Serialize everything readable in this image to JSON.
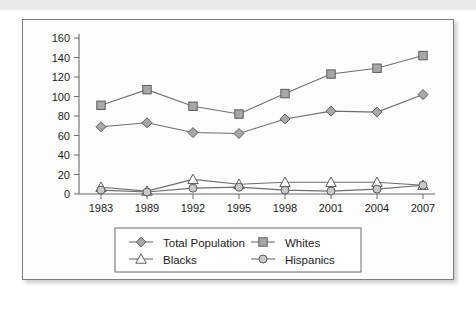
{
  "figure": {
    "frame_border_color": "#7d7d7d",
    "background_color": "#fdfdfd",
    "top_band_color": "#e8e8e8"
  },
  "chart_data": {
    "type": "line",
    "title": "",
    "subtitle": "",
    "xlabel": "",
    "ylabel": "",
    "categories": [
      "1983",
      "1989",
      "1992",
      "1995",
      "1998",
      "2001",
      "2004",
      "2007"
    ],
    "ylim": [
      0,
      160
    ],
    "yticks": [
      0,
      20,
      40,
      60,
      80,
      100,
      120,
      140,
      160
    ],
    "ytick_labels": [
      "0",
      "20",
      "40",
      "60",
      "80",
      "100",
      "120",
      "140",
      "160"
    ],
    "grid": false,
    "legend_position": "bottom",
    "series": [
      {
        "name": "Total Population",
        "marker": "diamond",
        "marker_style": "filled-gray",
        "values": [
          69,
          73,
          63,
          62,
          77,
          85,
          84,
          102
        ]
      },
      {
        "name": "Whites",
        "marker": "square",
        "marker_style": "filled-gray",
        "values": [
          91,
          107,
          90,
          82,
          103,
          123,
          129,
          142
        ]
      },
      {
        "name": "Blacks",
        "marker": "triangle",
        "marker_style": "open",
        "values": [
          7,
          3,
          15,
          10,
          12,
          12,
          12,
          9
        ]
      },
      {
        "name": "Hispanics",
        "marker": "circle",
        "marker_style": "filled-light-gray",
        "values": [
          4,
          2,
          6,
          7,
          4,
          3,
          5,
          9
        ]
      }
    ],
    "legend_entries": [
      {
        "label": "Total Population",
        "marker": "diamond"
      },
      {
        "label": "Whites",
        "marker": "square"
      },
      {
        "label": "Blacks",
        "marker": "triangle"
      },
      {
        "label": "Hispanics",
        "marker": "circle"
      }
    ]
  }
}
